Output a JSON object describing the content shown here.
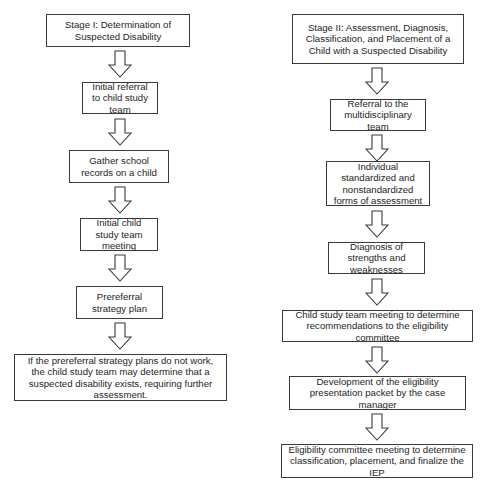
{
  "stage1": {
    "title": "Stage I: Determination of Suspected Disability",
    "steps": [
      "Initial referral to child study team",
      "Gather school records on a child",
      "Initial child study team meeting",
      "Prereferral strategy plan",
      "If the prereferral strategy plans do not work, the child study team may determine that a suspected disability exists, requiring further assessment."
    ]
  },
  "stage2": {
    "title": "Stage II: Assessment, Diagnosis, Classification, and Placement of a Child with a Suspected Disability",
    "steps": [
      "Referral to the multidisciplinary team",
      "Individual standardized and nonstandardized forms of assessment",
      "Diagnosis of strengths and weaknesses",
      "Child study team meeting to determine recommendations to the eligibility committee",
      "Development of the eligibility presentation packet by the case manager",
      "Eligibility committee meeting to determine classification, placement, and finalize the IEP"
    ]
  },
  "colors": {
    "stroke": "#3a3a3a",
    "text": "#1e1e1e",
    "background": "#ffffff"
  }
}
